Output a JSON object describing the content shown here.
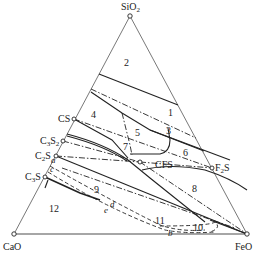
{
  "diagram": {
    "type": "ternary phase diagram",
    "vertices": {
      "top": "SiO2",
      "left": "CaO",
      "right": "FeO"
    },
    "compounds": [
      "CS",
      "C3S2",
      "C2S",
      "C3S",
      "CFS",
      "F2S"
    ],
    "region_numbers": [
      "1",
      "2",
      "3",
      "4",
      "5",
      "6",
      "7",
      "8",
      "9",
      "10",
      "11",
      "12"
    ],
    "curve_letters": [
      "a",
      "c",
      "d",
      "e",
      "b"
    ]
  },
  "labels": {
    "sio2": "SiO",
    "sio2_sub": "2",
    "cao": "CaO",
    "feo": "FeO",
    "cs": "CS",
    "c3s2_c": "C",
    "c3s2_sub1": "3",
    "c3s2_s": "S",
    "c3s2_sub2": "2",
    "c2s_c": "C",
    "c2s_sub": "2",
    "c2s_s": "S",
    "c3s_c": "C",
    "c3s_sub": "3",
    "c3s_s": "S",
    "cfs": "CFS",
    "f2s_f": "F",
    "f2s_sub": "2",
    "f2s_s": "S"
  },
  "regions": {
    "r1": "1",
    "r2": "2",
    "r3": "3",
    "r4": "4",
    "r5": "5",
    "r6": "6",
    "r7": "7",
    "r8": "8",
    "r9": "9",
    "r10": "10",
    "r11": "11",
    "r12": "12"
  },
  "letters": {
    "a": "a",
    "c": "c",
    "d": "d",
    "e": "e",
    "b": "b"
  }
}
